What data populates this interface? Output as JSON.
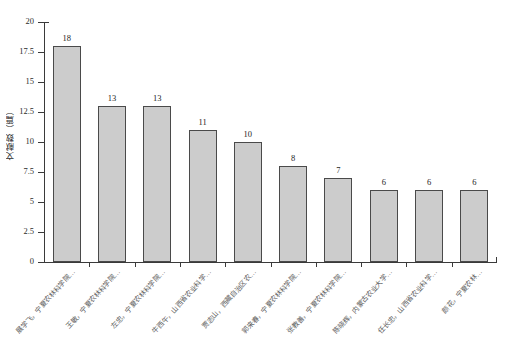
{
  "chart_data": {
    "type": "bar",
    "title": "",
    "xlabel": "",
    "ylabel": "文献数（篇）",
    "ylim": [
      0,
      20
    ],
    "ytick_values": [
      20,
      17.5,
      15,
      12.5,
      10,
      7.5,
      5,
      2.5,
      0
    ],
    "ytick_labels": [
      "20",
      "17.5",
      "15",
      "12.5",
      "10",
      "7.5",
      "5",
      "2.5",
      "0"
    ],
    "grid": false,
    "legend": null,
    "bar_color": "#cccccc",
    "bar_edge_color": "#4a4a4a",
    "categories": [
      "展学飞，宁夏农林科学院…",
      "王敏，宁夏农林科学院…",
      "左忠，宁夏农林科学院…",
      "牛西午，山西省农业科学…",
      "贾志山，西藏自治区农…",
      "郭来春，宁夏农林科学院…",
      "张教善，宁夏农林科学院…",
      "陈晓辉，内蒙古农业大学…",
      "任长忠，山西省农业科学…",
      "颜花，宁夏农林…"
    ],
    "values": [
      18,
      13,
      13,
      11,
      10,
      8,
      7,
      6,
      6,
      6
    ],
    "value_labels": [
      "18",
      "13",
      "13",
      "11",
      "10",
      "8",
      "7",
      "6",
      "6",
      "6"
    ]
  },
  "caption": ""
}
